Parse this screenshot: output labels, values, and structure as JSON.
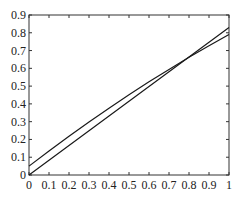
{
  "chart_data": {
    "type": "line",
    "title": "",
    "xlabel": "",
    "ylabel": "",
    "xlim": [
      0,
      1
    ],
    "ylim": [
      0,
      0.9
    ],
    "grid": false,
    "legend": null,
    "x_ticks": [
      "0",
      "0.1",
      "0.2",
      "0.3",
      "0.4",
      "0.5",
      "0.6",
      "0.7",
      "0.8",
      "0.9",
      "1"
    ],
    "y_ticks": [
      "0",
      "0.1",
      "0.2",
      "0.3",
      "0.4",
      "0.5",
      "0.6",
      "0.7",
      "0.8",
      "0.9"
    ],
    "series": [
      {
        "name": "line-1",
        "color": "#1a1a1a",
        "x": [
          0,
          0.1,
          0.2,
          0.3,
          0.4,
          0.5,
          0.6,
          0.7,
          0.8,
          0.9,
          1.0
        ],
        "y": [
          0,
          0.083,
          0.166,
          0.249,
          0.332,
          0.415,
          0.498,
          0.581,
          0.664,
          0.747,
          0.83
        ]
      },
      {
        "name": "line-2",
        "color": "#1a1a1a",
        "x": [
          0,
          0.1,
          0.2,
          0.3,
          0.4,
          0.5,
          0.6,
          0.7,
          0.8,
          0.9,
          1.0
        ],
        "y": [
          0.05,
          0.135,
          0.218,
          0.298,
          0.376,
          0.451,
          0.524,
          0.594,
          0.662,
          0.727,
          0.79
        ]
      }
    ]
  }
}
